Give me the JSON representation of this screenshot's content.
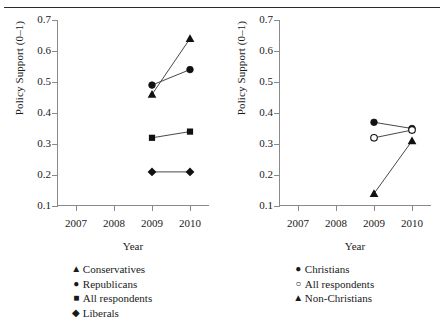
{
  "figure": {
    "top_rule": true,
    "background": "#ffffff",
    "ink": "#1a1a1a",
    "axis_color": "#8a8a8a"
  },
  "chart_data": [
    {
      "type": "line",
      "panel": "left",
      "title": "",
      "xlabel": "Year",
      "ylabel": "Policy Support (0–1)",
      "x": [
        2009,
        2010
      ],
      "xlim": [
        2006.5,
        2010.5
      ],
      "xticks": [
        2007,
        2008,
        2009,
        2010
      ],
      "xticklabels": [
        "2007",
        "2008",
        "2009",
        "2010"
      ],
      "ylim": [
        0.1,
        0.7
      ],
      "yticks": [
        0.1,
        0.2,
        0.3,
        0.4,
        0.5,
        0.6,
        0.7
      ],
      "yticklabels": [
        "0.1",
        "0.2",
        "0.3",
        "0.4",
        "0.5",
        "0.6",
        "0.7"
      ],
      "grid": false,
      "legend_position": "below",
      "series": [
        {
          "name": "Conservatives",
          "marker": "triangle",
          "values": [
            0.46,
            0.64
          ]
        },
        {
          "name": "Republicans",
          "marker": "circle",
          "values": [
            0.49,
            0.54
          ]
        },
        {
          "name": "All respondents",
          "marker": "square",
          "values": [
            0.32,
            0.34
          ]
        },
        {
          "name": "Liberals",
          "marker": "diamond",
          "values": [
            0.21,
            0.21
          ]
        }
      ]
    },
    {
      "type": "line",
      "panel": "right",
      "title": "",
      "xlabel": "Year",
      "ylabel": "Policy Support (0–1)",
      "x": [
        2009,
        2010
      ],
      "xlim": [
        2006.5,
        2010.5
      ],
      "xticks": [
        2007,
        2008,
        2009,
        2010
      ],
      "xticklabels": [
        "2007",
        "2008",
        "2009",
        "2010"
      ],
      "ylim": [
        0.1,
        0.7
      ],
      "yticks": [
        0.1,
        0.2,
        0.3,
        0.4,
        0.5,
        0.6,
        0.7
      ],
      "yticklabels": [
        "0.1",
        "0.2",
        "0.3",
        "0.4",
        "0.5",
        "0.6",
        "0.7"
      ],
      "grid": false,
      "legend_position": "below",
      "series": [
        {
          "name": "Christians",
          "marker": "circle",
          "values": [
            0.37,
            0.35
          ]
        },
        {
          "name": "All respondents",
          "marker": "circle-open",
          "values": [
            0.32,
            0.345
          ]
        },
        {
          "name": "Non-Christians",
          "marker": "triangle",
          "values": [
            0.14,
            0.31
          ]
        }
      ]
    }
  ],
  "legends": {
    "left": [
      {
        "glyph": "▲",
        "label": "Conservatives"
      },
      {
        "glyph": "●",
        "label": "Republicans"
      },
      {
        "glyph": "■",
        "label": "All respondents"
      },
      {
        "glyph": "◆",
        "label": "Liberals"
      }
    ],
    "right": [
      {
        "glyph": "●",
        "label": "Christians"
      },
      {
        "glyph": "○",
        "label": "All respondents"
      },
      {
        "glyph": "▲",
        "label": "Non-Christians"
      }
    ]
  }
}
